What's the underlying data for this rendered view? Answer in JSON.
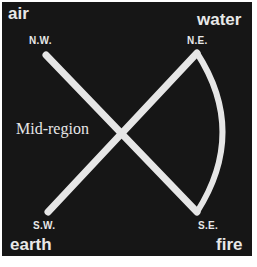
{
  "diagram": {
    "background": "#161616",
    "line_color": "#e6e6e6",
    "corners": {
      "nw": {
        "element": "air",
        "direction": "N.W."
      },
      "ne": {
        "element": "water",
        "direction": "N.E."
      },
      "sw": {
        "element": "earth",
        "direction": "S.W."
      },
      "se": {
        "element": "fire",
        "direction": "S.E."
      }
    },
    "center_label": "Mid-region",
    "shapes": [
      {
        "type": "line",
        "from": "N.W.",
        "to": "S.E."
      },
      {
        "type": "line",
        "from": "S.W.",
        "to": "N.E."
      },
      {
        "type": "arc",
        "from": "N.E.",
        "to": "S.E.",
        "bulge": "east"
      }
    ]
  }
}
